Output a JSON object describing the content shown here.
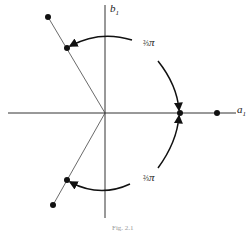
{
  "axes": {
    "x_label": "a",
    "x_sub": "1",
    "y_label": "b",
    "y_sub": "1"
  },
  "angle_labels": [
    {
      "frac": "⅔",
      "sym": "π",
      "position": "upper"
    },
    {
      "frac": "⅔",
      "sym": "π",
      "position": "lower"
    }
  ],
  "points": [
    {
      "name": "upper-outer",
      "x": 48,
      "y": 17
    },
    {
      "name": "upper-inner",
      "x": 67,
      "y": 48
    },
    {
      "name": "axis-inner",
      "x": 180,
      "y": 113
    },
    {
      "name": "axis-outer",
      "x": 217,
      "y": 113
    },
    {
      "name": "lower-inner",
      "x": 67,
      "y": 180
    },
    {
      "name": "lower-outer",
      "x": 53,
      "y": 205
    }
  ],
  "caption": "Fig. 2.1"
}
